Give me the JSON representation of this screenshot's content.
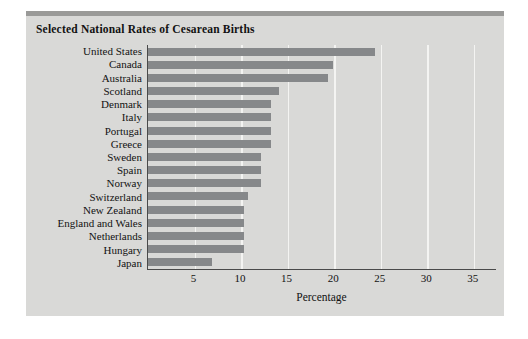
{
  "chart_data": {
    "type": "bar",
    "orientation": "horizontal",
    "title": "Selected National Rates of Cesarean Births",
    "xlabel": "Percentage",
    "ylabel": "",
    "xlim": [
      0,
      37.5
    ],
    "xticks": [
      5,
      10,
      15,
      20,
      25,
      30,
      35
    ],
    "grid": true,
    "legend": null,
    "categories": [
      "United States",
      "Canada",
      "Australia",
      "Scotland",
      "Denmark",
      "Italy",
      "Portugal",
      "Greece",
      "Sweden",
      "Spain",
      "Norway",
      "Switzerland",
      "New Zealand",
      "England and Wales",
      "Netherlands",
      "Hungary",
      "Japan"
    ],
    "values": [
      24.4,
      19.9,
      19.3,
      14.1,
      13.2,
      13.2,
      13.2,
      13.2,
      12.1,
      12.1,
      12.1,
      10.7,
      10.3,
      10.3,
      10.3,
      10.3,
      6.9
    ],
    "colors": {
      "bar": "#86888a",
      "panel_background": "#d9d9d7",
      "plot_background": "#d9d9d7",
      "gridline": "#f4f4f2",
      "axis": "#4a4a4a",
      "text": "#121212",
      "top_band": "#9a9a98",
      "page_background": "#ffffff"
    }
  }
}
